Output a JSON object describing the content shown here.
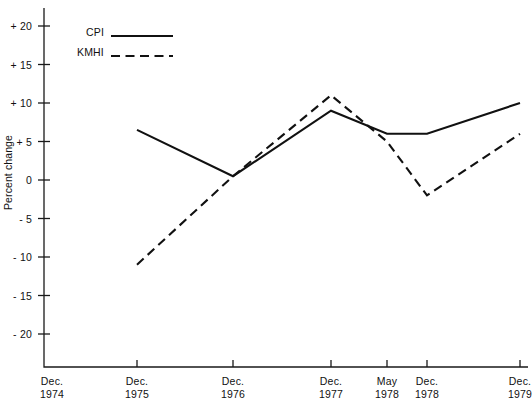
{
  "chart_data": {
    "type": "line",
    "title": "",
    "xlabel": "",
    "ylabel": "Percent change",
    "x": [
      "Dec. 1974",
      "Dec. 1975",
      "Dec. 1976",
      "Dec. 1977",
      "May 1978",
      "Dec. 1978",
      "Dec. 1979"
    ],
    "ylim": [
      -20,
      20
    ],
    "yticks": [
      20,
      15,
      10,
      5,
      0,
      -5,
      -10,
      -15,
      -20
    ],
    "ytick_labels": [
      "+ 20",
      "+ 15",
      "+ 10",
      "+ 5",
      "0",
      "- 5",
      "- 10",
      "- 15",
      "- 20"
    ],
    "grid": false,
    "legend_position": "top-left",
    "series": [
      {
        "name": "CPI",
        "style": "solid",
        "color": "#111111",
        "x": [
          "Dec. 1975",
          "Dec. 1976",
          "Dec. 1977",
          "May 1978",
          "Dec. 1978",
          "Dec. 1979"
        ],
        "values": [
          6.5,
          0.5,
          9.0,
          6.0,
          6.0,
          10.0
        ]
      },
      {
        "name": "KMHI",
        "style": "dashed",
        "color": "#111111",
        "x": [
          "Dec. 1975",
          "Dec. 1976",
          "Dec. 1977",
          "May 1978",
          "Dec. 1978",
          "Dec. 1979"
        ],
        "values": [
          -11.0,
          0.5,
          11.0,
          5.0,
          -2.0,
          6.0
        ]
      }
    ]
  },
  "axis": {
    "y_title": "Percent change",
    "x_labels": [
      {
        "line1": "Dec.",
        "line2": "1974"
      },
      {
        "line1": "Dec.",
        "line2": "1975"
      },
      {
        "line1": "Dec.",
        "line2": "1976"
      },
      {
        "line1": "Dec.",
        "line2": "1977"
      },
      {
        "line1": "May",
        "line2": "1978"
      },
      {
        "line1": "Dec.",
        "line2": "1978"
      },
      {
        "line1": "Dec.",
        "line2": "1979"
      }
    ],
    "y_labels": [
      "+ 20",
      "+ 15",
      "+ 10",
      "+ 5",
      "0",
      "- 5",
      "- 10",
      "- 15",
      "- 20"
    ]
  },
  "legend": {
    "items": [
      {
        "label": "CPI",
        "style": "solid"
      },
      {
        "label": "KMHI",
        "style": "dashed"
      }
    ]
  }
}
